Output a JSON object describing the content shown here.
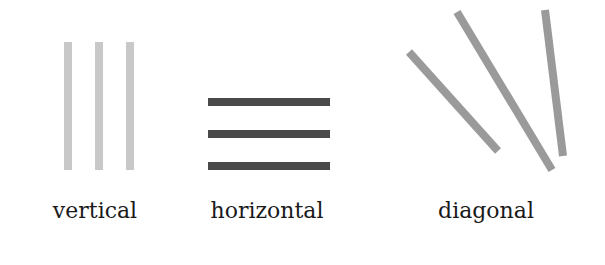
{
  "diagram": {
    "groups": [
      {
        "label": "vertical",
        "color": "#c8c8c8",
        "lines": [
          {
            "x1": 68,
            "y1": 42,
            "x2": 68,
            "y2": 170
          },
          {
            "x1": 99,
            "y1": 42,
            "x2": 99,
            "y2": 170
          },
          {
            "x1": 130,
            "y1": 42,
            "x2": 130,
            "y2": 170
          }
        ]
      },
      {
        "label": "horizontal",
        "color": "#4a4a4a",
        "lines": [
          {
            "x1": 208,
            "y1": 102,
            "x2": 330,
            "y2": 102
          },
          {
            "x1": 208,
            "y1": 134,
            "x2": 330,
            "y2": 134
          },
          {
            "x1": 208,
            "y1": 166,
            "x2": 330,
            "y2": 166
          }
        ]
      },
      {
        "label": "diagonal",
        "color": "#9a9a9a",
        "lines": [
          {
            "x1": 409,
            "y1": 52,
            "x2": 498,
            "y2": 151
          },
          {
            "x1": 457,
            "y1": 12,
            "x2": 552,
            "y2": 170
          },
          {
            "x1": 545,
            "y1": 10,
            "x2": 563,
            "y2": 156
          }
        ]
      }
    ]
  }
}
